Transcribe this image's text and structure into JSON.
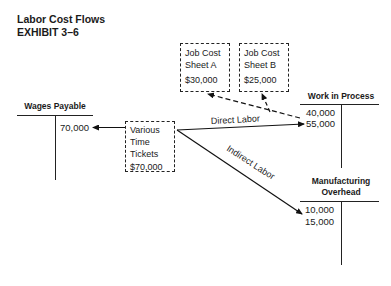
{
  "header": {
    "title": "Labor Cost Flows",
    "exhibit": "EXHIBIT 3–6"
  },
  "job_sheets": [
    {
      "line1": "Job Cost",
      "line2": "Sheet A",
      "amount": "$30,000"
    },
    {
      "line1": "Job Cost",
      "line2": "Sheet B",
      "amount": "$25,000"
    }
  ],
  "time_tickets": {
    "line1": "Various",
    "line2": "Time",
    "line3": "Tickets",
    "amount": "$70,000"
  },
  "accounts": {
    "wages_payable": {
      "title": "Wages Payable",
      "credit": [
        "70,000"
      ]
    },
    "work_in_process": {
      "title": "Work in Process",
      "debit": [
        "40,000",
        "55,000"
      ]
    },
    "manufacturing_overhead": {
      "title_line1": "Manufacturing",
      "title_line2": "Overhead",
      "debit": [
        "10,000",
        "15,000"
      ]
    }
  },
  "flows": {
    "direct_label": "Direct Labor",
    "indirect_label": "Indirect Labor"
  }
}
